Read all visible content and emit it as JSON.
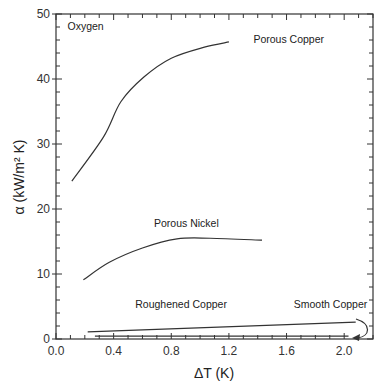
{
  "chart_data": {
    "type": "line",
    "title": "",
    "xlabel": "ΔT (K)",
    "ylabel": "α (kW/m² K)",
    "xlim": [
      0,
      2.2
    ],
    "ylim": [
      0,
      50
    ],
    "x_ticks": [
      0.0,
      0.4,
      0.8,
      1.2,
      1.6,
      2.0
    ],
    "x_tick_labels": [
      "0.0",
      "0.4",
      "0.8",
      "1.2",
      "1.6",
      "2.0"
    ],
    "x_minor_step": 0.1,
    "y_ticks": [
      0,
      10,
      20,
      30,
      40,
      50
    ],
    "y_tick_labels": [
      "0",
      "10",
      "20",
      "30",
      "40",
      "50"
    ],
    "y_minor_step": 2,
    "grid": false,
    "legend": "none",
    "annotations": [
      {
        "text": "Oxygen",
        "x": 0.08,
        "y": 47.5
      },
      {
        "text": "Porous Copper",
        "x": 1.37,
        "y": 45.5
      },
      {
        "text": "Porous Nickel",
        "x": 0.68,
        "y": 17.2
      },
      {
        "text": "Roughened Copper",
        "x": 0.55,
        "y": 4.7
      },
      {
        "text": "Smooth Copper",
        "x": 1.65,
        "y": 4.7
      }
    ],
    "series": [
      {
        "name": "Porous Copper",
        "x": [
          0.11,
          0.33,
          0.45,
          0.61,
          0.8,
          1.03,
          1.2
        ],
        "y": [
          24.3,
          31.1,
          36.5,
          40.3,
          43.2,
          44.9,
          45.7
        ]
      },
      {
        "name": "Porous Nickel",
        "x": [
          0.19,
          0.37,
          0.6,
          0.84,
          1.07,
          1.43
        ],
        "y": [
          9.1,
          11.8,
          14.0,
          15.4,
          15.5,
          15.2
        ]
      },
      {
        "name": "Roughened Copper",
        "x": [
          0.22,
          2.08
        ],
        "y": [
          1.1,
          2.6
        ]
      },
      {
        "name": "Smooth Copper",
        "x": [
          0.27,
          2.03
        ],
        "y": [
          0.45,
          0.45
        ]
      }
    ],
    "arrow": {
      "label": "Smooth Copper",
      "points_to": "Smooth Copper"
    }
  }
}
